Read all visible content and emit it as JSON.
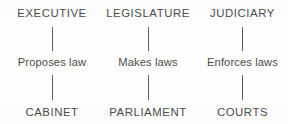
{
  "diagram": {
    "background_color": "#fefefe",
    "text_color": "#4c4c4c",
    "line_color": "#5a5a5a",
    "columns": [
      {
        "id": "executive",
        "top_label": "EXECUTIVE",
        "middle_label": "Proposes law",
        "bottom_label": "CABINET"
      },
      {
        "id": "legislature",
        "top_label": "LEGISLATURE",
        "middle_label": "Makes laws",
        "bottom_label": "PARLIAMENT"
      },
      {
        "id": "judiciary",
        "top_label": "JUDICIARY",
        "middle_label": "Enforces laws",
        "bottom_label": "COURTS"
      }
    ]
  }
}
